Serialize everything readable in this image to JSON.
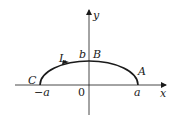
{
  "diagram": {
    "type": "upper half-ellipse curve L in the xy-plane, oriented from A through B to C",
    "axes": {
      "x_label": "x",
      "y_label": "y",
      "origin_label": "0"
    },
    "ticks": {
      "neg_a": "−a",
      "pos_a": "a",
      "b": "b"
    },
    "points": {
      "A": "A",
      "B": "B",
      "C": "C"
    },
    "curve_label": "L",
    "colors": {
      "stroke": "#1a1a1a",
      "background": "#ffffff"
    }
  }
}
